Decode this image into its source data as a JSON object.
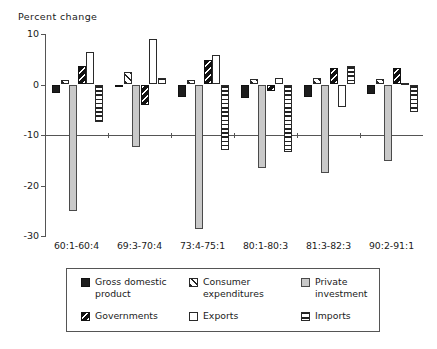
{
  "chart_data": {
    "type": "bar",
    "title": "Percent change",
    "ylabel": "Percent change",
    "xlabel": "",
    "ylim": [
      -30,
      10
    ],
    "yticks": [
      10,
      0,
      -10,
      -20,
      -30
    ],
    "ytick_labels": [
      "10",
      "0",
      "-10",
      "-20",
      "-30"
    ],
    "grid": false,
    "legend_position": "bottom",
    "categories": [
      "60:1-60:4",
      "69:3-70:4",
      "73:4-75:1",
      "80:1-80:3",
      "81:3-82:3",
      "90:2-91:1"
    ],
    "series": [
      {
        "name": "Gross domestic product",
        "pattern": "solid-black",
        "values": [
          -1.6,
          -0.5,
          -2.4,
          -2.7,
          -2.4,
          -1.9
        ]
      },
      {
        "name": "Consumer expenditures",
        "pattern": "diagonal-hatch-forward",
        "values": [
          0.8,
          2.4,
          0.9,
          1.1,
          1.2,
          1.0
        ]
      },
      {
        "name": "Private investment",
        "pattern": "solid-gray",
        "values": [
          -25.0,
          -12.3,
          -28.6,
          -16.5,
          -17.5,
          -15.1
        ]
      },
      {
        "name": "Governments",
        "pattern": "diagonal-hatch-back-dark",
        "values": [
          3.7,
          -4.0,
          4.9,
          -1.2,
          3.3,
          3.2
        ]
      },
      {
        "name": "Exports",
        "pattern": "white-outline",
        "values": [
          6.5,
          9.0,
          5.8,
          1.3,
          -4.4,
          0.3
        ]
      },
      {
        "name": "Imports",
        "pattern": "horizontal-stripes",
        "values": [
          -7.4,
          1.2,
          -13.0,
          -13.4,
          3.6,
          -5.4
        ]
      }
    ]
  },
  "legend": {
    "items": [
      {
        "label": "Gross domestic product",
        "swatch": "solid-black-swatch"
      },
      {
        "label": "Consumer expenditures",
        "swatch": "hatch-forward-swatch"
      },
      {
        "label": "Private investment",
        "swatch": "solid-gray-swatch"
      },
      {
        "label": "Governments",
        "swatch": "hatch-back-swatch"
      },
      {
        "label": "Exports",
        "swatch": "white-outline-swatch"
      },
      {
        "label": "Imports",
        "swatch": "horizontal-stripes-swatch"
      }
    ]
  }
}
